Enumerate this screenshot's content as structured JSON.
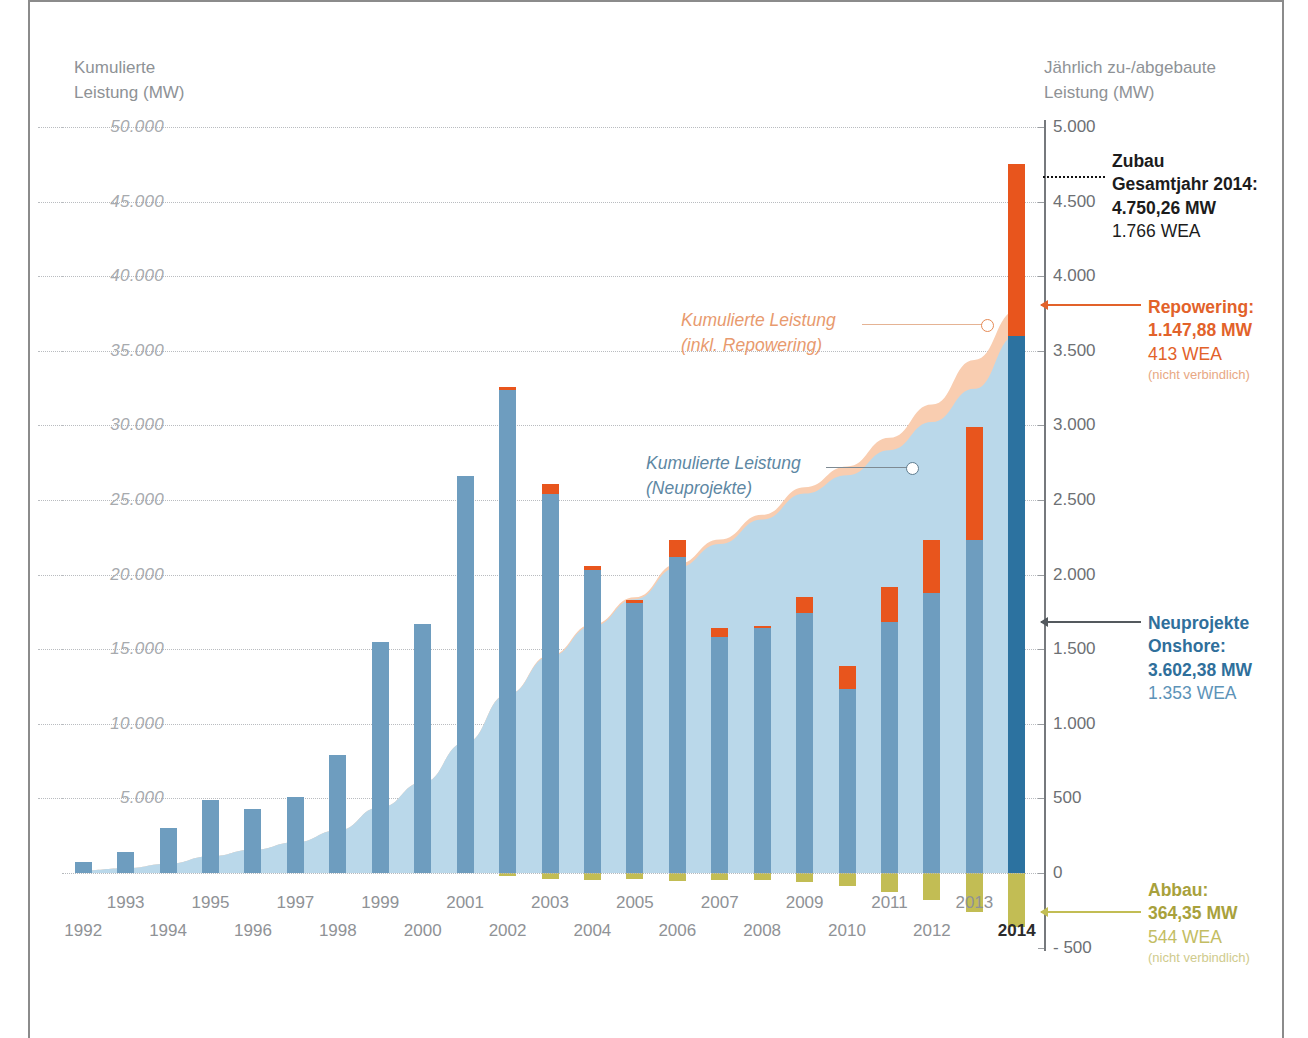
{
  "axes": {
    "left_title": "Kumulierte\nLeistung (MW)",
    "left_title_line1": "Kumulierte",
    "left_title_line2": "Leistung (MW)",
    "right_title_line1": "Jährlich zu-/abgebaute",
    "right_title_line2": "Leistung (MW)",
    "left_ticks": [
      "50.000",
      "45.000",
      "40.000",
      "35.000",
      "30.000",
      "25.000",
      "20.000",
      "15.000",
      "10.000",
      "5.000"
    ],
    "right_ticks": [
      "5.000",
      "4.500",
      "4.000",
      "3.500",
      "3.000",
      "2.500",
      "2.000",
      "1.500",
      "1.000",
      "500",
      "0",
      "- 500"
    ]
  },
  "callouts": {
    "cumulative_incl_repowering_line1": "Kumulierte Leistung",
    "cumulative_incl_repowering_line2": "(inkl. Repowering)",
    "cumulative_new_line1": "Kumulierte Leistung",
    "cumulative_new_line2": "(Neuprojekte)"
  },
  "annotations": {
    "zubau": {
      "line1": "Zubau",
      "line2": "Gesamtjahr 2014:",
      "value": "4.750,26 MW",
      "units": "1.766 WEA"
    },
    "repowering": {
      "line1": "Repowering:",
      "value": "1.147,88 MW",
      "units": "413 WEA",
      "note": "(nicht verbindlich)"
    },
    "neuprojekte": {
      "line1": "Neuprojekte",
      "line2": "Onshore:",
      "value": "3.602,38 MW",
      "units": "1.353 WEA"
    },
    "abbau": {
      "line1": "Abbau:",
      "value": "364,35 MW",
      "units": "544 WEA",
      "note": "(nicht verbindlich)"
    }
  },
  "colors": {
    "blue_bar": "#6e9dbf",
    "blue_bar_highlight": "#2c72a0",
    "orange_bar": "#e8551d",
    "olive_bar": "#c2bd54",
    "area_new": "#bad8ea",
    "area_repowering": "#f9cdb0",
    "grid": "#b9bcc0"
  },
  "chart_data": {
    "type": "bar",
    "title": "",
    "xlabel": "",
    "ylabel": "Jährlich zu-/abgebaute Leistung (MW)",
    "ylabel_left": "Kumulierte Leistung (MW)",
    "ylim_right": [
      -500,
      5000
    ],
    "ylim_left": [
      0,
      50000
    ],
    "grid": true,
    "legend": "inline-callouts",
    "categories": [
      "1992",
      "1993",
      "1994",
      "1995",
      "1996",
      "1997",
      "1998",
      "1999",
      "2000",
      "2001",
      "2002",
      "2003",
      "2004",
      "2005",
      "2006",
      "2007",
      "2008",
      "2009",
      "2010",
      "2011",
      "2012",
      "2013",
      "2014"
    ],
    "series": [
      {
        "name": "Neuprojekte Onshore (jährlicher Zubau, MW)",
        "color": "#6e9dbf",
        "values": [
          75,
          140,
          300,
          490,
          430,
          510,
          790,
          1550,
          1670,
          2660,
          3240,
          2540,
          2030,
          1810,
          2120,
          1580,
          1640,
          1740,
          1230,
          1680,
          1880,
          2230,
          3602.38
        ]
      },
      {
        "name": "Repowering (MW)",
        "color": "#e8551d",
        "values": [
          0,
          0,
          0,
          0,
          0,
          0,
          0,
          0,
          0,
          0,
          15,
          70,
          30,
          20,
          110,
          60,
          15,
          110,
          160,
          240,
          350,
          760,
          1147.88
        ]
      },
      {
        "name": "Abbau (MW)",
        "color": "#c2bd54",
        "values": [
          0,
          0,
          0,
          0,
          0,
          0,
          0,
          0,
          0,
          0,
          -20,
          -40,
          -50,
          -40,
          -55,
          -50,
          -45,
          -60,
          -90,
          -130,
          -180,
          -260,
          -364.35
        ]
      },
      {
        "name": "Kumulierte Leistung (Neuprojekte) (MW)",
        "color": "#bad8ea",
        "values": [
          180,
          320,
          620,
          1120,
          1550,
          2060,
          2850,
          4400,
          6070,
          8730,
          11970,
          14510,
          16540,
          18350,
          20470,
          22050,
          23690,
          25430,
          26660,
          28340,
          30220,
          32450,
          36050
        ]
      },
      {
        "name": "Kumulierte Leistung (inkl. Repowering) (MW)",
        "color": "#f9cdb0",
        "values": [
          180,
          320,
          620,
          1120,
          1550,
          2060,
          2850,
          4400,
          6070,
          8730,
          11985,
          14595,
          16655,
          18485,
          20715,
          22355,
          24010,
          25860,
          27250,
          29170,
          31400,
          34390,
          37700
        ]
      }
    ]
  }
}
